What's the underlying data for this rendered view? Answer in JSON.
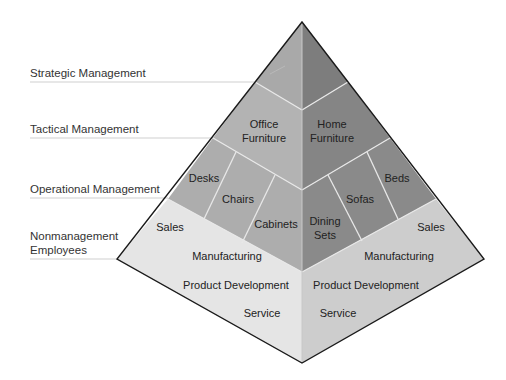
{
  "colors": {
    "strategic_left": "#a9a9a9",
    "strategic_right": "#7d7d7d",
    "tactical_left": "#b3b3b3",
    "tactical_right": "#858585",
    "operational_left": "#adadad",
    "operational_right": "#8a8a8a",
    "nonmgmt_left": "#e5e5e5",
    "nonmgmt_right": "#cdcdcd",
    "outline": "#1a1a1a",
    "divider": "#e8e8e8",
    "rule": "#cfcfcf"
  },
  "levels": [
    {
      "id": "strategic",
      "label": "Strategic Management"
    },
    {
      "id": "tactical",
      "label": "Tactical Management"
    },
    {
      "id": "operational",
      "label": "Operational Management"
    },
    {
      "id": "nonmanagement",
      "label_line1": "Nonmanagement",
      "label_line2": "Employees"
    }
  ],
  "pyramid": {
    "tactical": {
      "left": {
        "line1": "Office",
        "line2": "Furniture"
      },
      "right": {
        "line1": "Home",
        "line2": "Furniture"
      }
    },
    "operational": {
      "left": [
        "Desks",
        "Chairs",
        "Cabinets"
      ],
      "right": {
        "dining_line1": "Dining",
        "dining_line2": "Sets",
        "sofas": "Sofas",
        "beds": "Beds"
      }
    },
    "nonmanagement": {
      "left": [
        "Sales",
        "Manufacturing",
        "Product Development",
        "Service"
      ],
      "right": [
        "Sales",
        "Manufacturing",
        "Product Development",
        "Service"
      ]
    }
  }
}
